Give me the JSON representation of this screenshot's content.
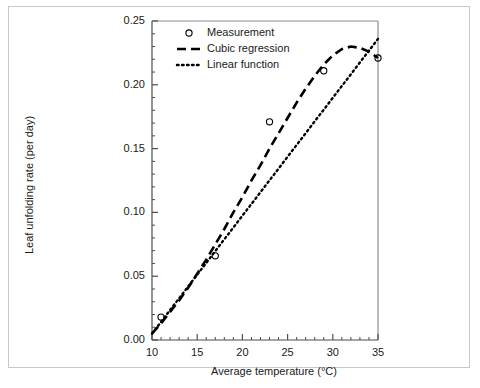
{
  "chart_data": {
    "type": "line",
    "title": "",
    "xlabel": "Average temperature (°C)",
    "ylabel": "Leaf unfolding rate (per day)",
    "xlim": [
      10,
      35
    ],
    "ylim": [
      0.0,
      0.25
    ],
    "xticks": [
      10,
      15,
      20,
      25,
      30,
      35
    ],
    "xtick_labels": [
      "10",
      "15",
      "20",
      "25",
      "30",
      "35"
    ],
    "x_minor_tick_step": 1,
    "yticks": [
      0.0,
      0.05,
      0.1,
      0.15,
      0.2,
      0.25
    ],
    "ytick_labels": [
      "0.00",
      "0.05",
      "0.10",
      "0.15",
      "0.20",
      "0.25"
    ],
    "y_minor_tick_step": 0.01,
    "grid": false,
    "legend_position": "top-left",
    "series": [
      {
        "name": "Measurement",
        "style": "marker",
        "marker": "open-circle",
        "color": "#000000",
        "x": [
          11,
          17,
          23,
          29,
          35
        ],
        "values": [
          0.018,
          0.066,
          0.171,
          0.211,
          0.221
        ]
      },
      {
        "name": "Cubic regression",
        "style": "dashed",
        "color": "#000000",
        "x": [
          10,
          11,
          12,
          13,
          14,
          15,
          16,
          17,
          18,
          19,
          20,
          21,
          22,
          23,
          24,
          25,
          26,
          27,
          28,
          29,
          30,
          31,
          32,
          33,
          34,
          35
        ],
        "values": [
          0.005,
          0.013,
          0.022,
          0.031,
          0.041,
          0.052,
          0.063,
          0.075,
          0.087,
          0.1,
          0.112,
          0.125,
          0.137,
          0.15,
          0.162,
          0.174,
          0.186,
          0.197,
          0.207,
          0.216,
          0.223,
          0.228,
          0.23,
          0.229,
          0.226,
          0.221
        ]
      },
      {
        "name": "Linear function",
        "style": "dotted",
        "color": "#000000",
        "x": [
          10,
          35
        ],
        "values": [
          0.005,
          0.236
        ]
      }
    ]
  },
  "legend": {
    "items": [
      {
        "label": "Measurement",
        "marker": "open-circle"
      },
      {
        "label": "Cubic regression",
        "marker": "dashed-line"
      },
      {
        "label": "Linear function",
        "marker": "dotted-line"
      }
    ]
  }
}
